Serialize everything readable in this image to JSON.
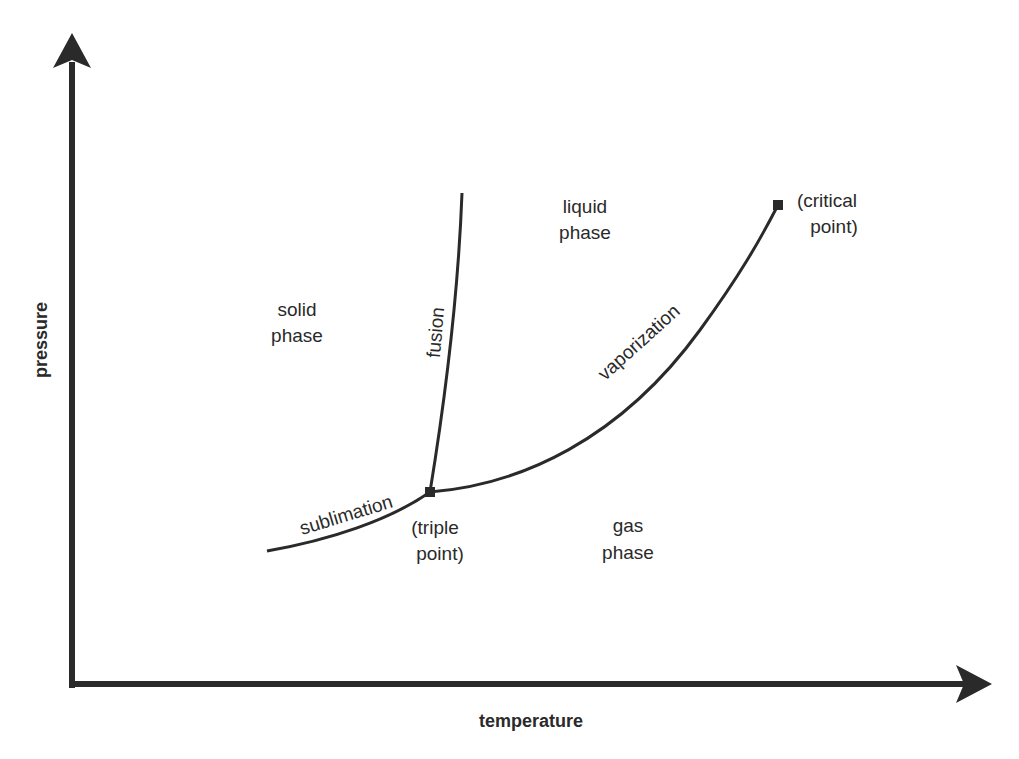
{
  "diagram": {
    "axes": {
      "x_label": "temperature",
      "y_label": "pressure"
    },
    "regions": {
      "solid": [
        "solid",
        "phase"
      ],
      "liquid": [
        "liquid",
        "phase"
      ],
      "gas": [
        "gas",
        "phase"
      ]
    },
    "curves": {
      "fusion": "fusion",
      "vaporization": "vaporization",
      "sublimation": "sublimation"
    },
    "points": {
      "triple": [
        "(triple",
        "point)"
      ],
      "critical": [
        "(critical",
        "point)"
      ]
    },
    "colors": {
      "line": "#2a2a2a",
      "text": "#2a2a2a",
      "background": "#ffffff"
    }
  }
}
